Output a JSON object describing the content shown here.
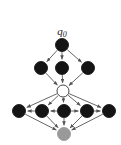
{
  "figure": {
    "title_label": "q0",
    "background_color": "#ffffff",
    "edge_color": "#555555",
    "start_label": {
      "text": "q",
      "subscript": "0",
      "x": 62,
      "y": 35
    }
  },
  "chart_data": {
    "type": "diagram",
    "title": "q0",
    "xlabel": "",
    "ylabel": "",
    "legend": [
      {
        "name": "visited-node",
        "color": "#141414",
        "shape": "filled-circle"
      },
      {
        "name": "frontier-node",
        "color": "#ffffff",
        "shape": "open-circle"
      },
      {
        "name": "goal-node",
        "color": "#999999",
        "shape": "gray-circle"
      }
    ],
    "nodes": [
      {
        "id": "n0",
        "label": "q0",
        "level": 0,
        "x": 62,
        "y": 45,
        "r": 6.5,
        "fill": "#141414",
        "stroke": "#141414",
        "kind": "visited"
      },
      {
        "id": "n1",
        "label": "",
        "level": 1,
        "x": 41,
        "y": 68,
        "r": 6.5,
        "fill": "#141414",
        "stroke": "#141414",
        "kind": "visited"
      },
      {
        "id": "n2",
        "label": "",
        "level": 1,
        "x": 62,
        "y": 68,
        "r": 6.5,
        "fill": "#141414",
        "stroke": "#141414",
        "kind": "visited"
      },
      {
        "id": "n3",
        "label": "",
        "level": 1,
        "x": 88,
        "y": 68,
        "r": 6.5,
        "fill": "#141414",
        "stroke": "#141414",
        "kind": "visited"
      },
      {
        "id": "n4",
        "label": "",
        "level": 2,
        "x": 63,
        "y": 91,
        "r": 6.0,
        "fill": "#ffffff",
        "stroke": "#333333",
        "kind": "frontier"
      },
      {
        "id": "n5",
        "label": "",
        "level": 3,
        "x": 19,
        "y": 111,
        "r": 6.5,
        "fill": "#141414",
        "stroke": "#141414",
        "kind": "visited"
      },
      {
        "id": "n6",
        "label": "",
        "level": 3,
        "x": 42,
        "y": 111,
        "r": 6.5,
        "fill": "#141414",
        "stroke": "#141414",
        "kind": "visited"
      },
      {
        "id": "n7",
        "label": "",
        "level": 3,
        "x": 64,
        "y": 111,
        "r": 6.5,
        "fill": "#141414",
        "stroke": "#141414",
        "kind": "visited"
      },
      {
        "id": "n8",
        "label": "",
        "level": 3,
        "x": 87,
        "y": 111,
        "r": 6.5,
        "fill": "#141414",
        "stroke": "#141414",
        "kind": "visited"
      },
      {
        "id": "n9",
        "label": "",
        "level": 3,
        "x": 109,
        "y": 111,
        "r": 6.5,
        "fill": "#141414",
        "stroke": "#141414",
        "kind": "visited"
      },
      {
        "id": "n10",
        "label": "",
        "level": 4,
        "x": 64,
        "y": 134,
        "r": 6.5,
        "fill": "#999999",
        "stroke": "#999999",
        "kind": "goal"
      }
    ],
    "edges": [
      {
        "from": "n0",
        "to": "n1",
        "directed": true
      },
      {
        "from": "n0",
        "to": "n2",
        "directed": true
      },
      {
        "from": "n0",
        "to": "n3",
        "directed": true
      },
      {
        "from": "n1",
        "to": "n4",
        "directed": true
      },
      {
        "from": "n2",
        "to": "n4",
        "directed": true
      },
      {
        "from": "n3",
        "to": "n4",
        "directed": true
      },
      {
        "from": "n4",
        "to": "n5",
        "directed": true
      },
      {
        "from": "n4",
        "to": "n6",
        "directed": true
      },
      {
        "from": "n4",
        "to": "n7",
        "directed": true
      },
      {
        "from": "n4",
        "to": "n8",
        "directed": true
      },
      {
        "from": "n4",
        "to": "n9",
        "directed": true
      },
      {
        "from": "n6",
        "to": "n5",
        "directed": true
      },
      {
        "from": "n7",
        "to": "n6",
        "directed": true
      },
      {
        "from": "n7",
        "to": "n8",
        "directed": true
      },
      {
        "from": "n8",
        "to": "n9",
        "directed": true
      },
      {
        "from": "n5",
        "to": "n10",
        "directed": true
      },
      {
        "from": "n6",
        "to": "n10",
        "directed": true
      },
      {
        "from": "n7",
        "to": "n10",
        "directed": true
      },
      {
        "from": "n8",
        "to": "n10",
        "directed": true
      },
      {
        "from": "n9",
        "to": "n10",
        "directed": true
      }
    ]
  }
}
